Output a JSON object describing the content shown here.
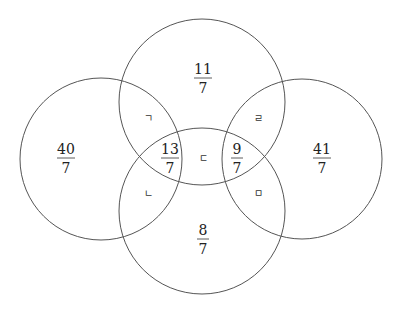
{
  "diagram": {
    "type": "four-circle-venn",
    "stroke_color": "#555555",
    "background": "#ffffff",
    "circles": [
      {
        "id": "top",
        "cx": 202,
        "cy": 102,
        "r": 83
      },
      {
        "id": "left",
        "cx": 101,
        "cy": 159,
        "r": 81
      },
      {
        "id": "right",
        "cx": 302,
        "cy": 159,
        "r": 80
      },
      {
        "id": "bottom",
        "cx": 202,
        "cy": 211,
        "r": 83
      }
    ],
    "fractions": [
      {
        "id": "top-only",
        "num": "11",
        "den": "7",
        "x": 203,
        "y": 77
      },
      {
        "id": "left-only",
        "num": "40",
        "den": "7",
        "x": 66,
        "y": 157
      },
      {
        "id": "right-only",
        "num": "41",
        "den": "7",
        "x": 322,
        "y": 157
      },
      {
        "id": "bottom-only",
        "num": "8",
        "den": "7",
        "x": 203,
        "y": 238
      },
      {
        "id": "left-center",
        "num": "13",
        "den": "7",
        "x": 170,
        "y": 157
      },
      {
        "id": "right-center",
        "num": "9",
        "den": "7",
        "x": 237,
        "y": 157
      }
    ],
    "jamo_labels": [
      {
        "id": "top-left-overlap",
        "text": "ㄱ",
        "x": 148,
        "y": 118
      },
      {
        "id": "top-right-overlap",
        "text": "ㄹ",
        "x": 258,
        "y": 118
      },
      {
        "id": "center",
        "text": "ㄷ",
        "x": 203,
        "y": 158
      },
      {
        "id": "bottom-left-overlap",
        "text": "ㄴ",
        "x": 148,
        "y": 193
      },
      {
        "id": "bottom-right-overlap",
        "text": "ㅁ",
        "x": 258,
        "y": 193
      }
    ]
  }
}
